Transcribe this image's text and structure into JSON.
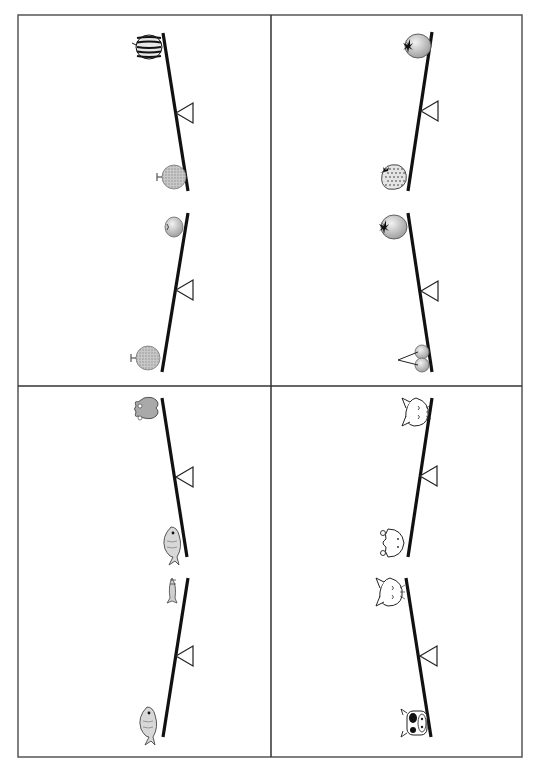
{
  "worksheet": {
    "title": "",
    "grid": {
      "left": 18,
      "top": 15,
      "right": 522,
      "bottom": 757,
      "vdivider_x": 271,
      "hdivider_y": 386,
      "border_color": "#555555"
    },
    "colors": {
      "beam": "#111111",
      "fulcrum_stroke": "#222222",
      "fulcrum_fill": "#ffffff",
      "fruit_gray": "#bdbdbd",
      "fruit_dark": "#1a1a1a"
    },
    "panels": [
      {
        "id": "top-left",
        "seesaws": [
          {
            "beam": [
              163,
              33,
              188,
              191
            ],
            "fulcrum": [
              176,
              113
            ],
            "top_item": "watermelon",
            "bottom_item": "melon"
          },
          {
            "beam": [
              188,
              213,
              162,
              372
            ],
            "fulcrum": [
              176,
              290
            ],
            "top_item": "apple",
            "bottom_item": "melon"
          }
        ]
      },
      {
        "id": "top-right",
        "seesaws": [
          {
            "beam": [
              432,
              32,
              408,
              191
            ],
            "fulcrum": [
              421,
              111
            ],
            "top_item": "tomato",
            "bottom_item": "strawberry"
          },
          {
            "beam": [
              408,
              213,
              432,
              372
            ],
            "fulcrum": [
              421,
              291
            ],
            "top_item": "tomato",
            "bottom_item": "cherries"
          }
        ]
      },
      {
        "id": "bottom-left",
        "seesaws": [
          {
            "beam": [
              162,
              398,
              187,
              557
            ],
            "fulcrum": [
              176,
              477
            ],
            "top_item": "frog",
            "bottom_item": "sea-bream"
          },
          {
            "beam": [
              188,
              578,
              163,
              737
            ],
            "fulcrum": [
              176,
              656
            ],
            "top_item": "small-fish",
            "bottom_item": "sea-bream"
          }
        ]
      },
      {
        "id": "bottom-right",
        "seesaws": [
          {
            "beam": [
              432,
              398,
              408,
              557
            ],
            "fulcrum": [
              420,
              476
            ],
            "top_item": "cat",
            "bottom_item": "hippo"
          },
          {
            "beam": [
              406,
              578,
              431,
              737
            ],
            "fulcrum": [
              420,
              656
            ],
            "top_item": "cat",
            "bottom_item": "cow"
          }
        ]
      }
    ]
  }
}
